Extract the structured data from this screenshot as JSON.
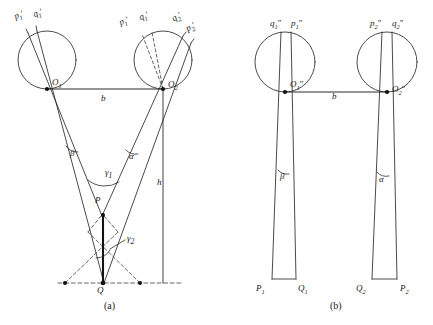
{
  "figure": {
    "captions": [
      {
        "id": "caption-a",
        "text": "(a)",
        "x": 104,
        "y": 302
      },
      {
        "id": "caption-b",
        "text": "(b)",
        "x": 330,
        "y": 302
      }
    ],
    "colors": {
      "stroke": "#2b2b2b",
      "background": "#ffffff",
      "dashed": "#4a4a4a",
      "heavy": "#111111"
    }
  },
  "panel_a": {
    "name": "(a)",
    "circles": [
      {
        "id": "circle-left-a",
        "cx": 47,
        "cy": 60,
        "r": 29,
        "center_label": "O",
        "center_sub": "1"
      },
      {
        "id": "circle-right-a",
        "cx": 163,
        "cy": 60,
        "r": 29,
        "center_label": "O",
        "center_sub": "2"
      }
    ],
    "ray_labels": [
      {
        "id": "label-p1-prime-left",
        "base": "p",
        "sub": "1",
        "prime": "′",
        "x": 17,
        "y": 12,
        "rot": -22
      },
      {
        "id": "label-q1-prime-left",
        "base": "q",
        "sub": "1",
        "prime": "′",
        "x": 36,
        "y": 10,
        "rot": -22
      },
      {
        "id": "label-p1-prime-right",
        "base": "p",
        "sub": "1",
        "prime": "′",
        "x": 122,
        "y": 18,
        "rot": -22
      },
      {
        "id": "label-q1-prime-right",
        "base": "q",
        "sub": "1",
        "prime": "′",
        "x": 142,
        "y": 13,
        "rot": -22
      },
      {
        "id": "label-q2-prime-right",
        "base": "q",
        "sub": "2",
        "prime": "′",
        "x": 176,
        "y": 14,
        "rot": -30
      },
      {
        "id": "label-p2-prime-right",
        "base": "p",
        "sub": "2",
        "prime": "′",
        "x": 190,
        "y": 24,
        "rot": -30
      }
    ],
    "point_labels": [
      {
        "id": "label-O1",
        "base": "O",
        "sub": "1",
        "prime": "",
        "x": 52,
        "y": 80
      },
      {
        "id": "label-O2",
        "base": "O",
        "sub": "2",
        "prime": "",
        "x": 168,
        "y": 82
      },
      {
        "id": "label-P",
        "base": "P",
        "sub": "",
        "prime": "",
        "x": 96,
        "y": 198
      },
      {
        "id": "label-Q",
        "base": "Q",
        "sub": "",
        "prime": "",
        "x": 97,
        "y": 288
      }
    ],
    "measure_labels": [
      {
        "id": "label-b-a",
        "text": "b",
        "x": 101,
        "y": 97
      },
      {
        "id": "label-h-a",
        "text": "h",
        "x": 158,
        "y": 180
      }
    ],
    "angle_labels": [
      {
        "id": "angle-beta-a",
        "text": "β",
        "x": 71,
        "y": 152
      },
      {
        "id": "angle-alpha-a",
        "text": "α",
        "x": 130,
        "y": 155
      },
      {
        "id": "angle-gamma1-a",
        "text": "γ",
        "sub": "1",
        "x": 106,
        "y": 171
      },
      {
        "id": "angle-gamma2-a",
        "text": "γ",
        "sub": "2",
        "x": 128,
        "y": 237
      }
    ]
  },
  "panel_b": {
    "name": "(b)",
    "circles": [
      {
        "id": "circle-left-b",
        "cx": 285,
        "cy": 62,
        "r": 30,
        "center_label": "O",
        "center_sub": "1",
        "center_prime": "″"
      },
      {
        "id": "circle-right-b",
        "cx": 387,
        "cy": 62,
        "r": 30,
        "center_label": "O",
        "center_sub": "2",
        "center_prime": "″"
      }
    ],
    "ray_labels": [
      {
        "id": "label-q1-dprime-left",
        "base": "q",
        "sub": "1",
        "prime": "″",
        "x": 272,
        "y": 20
      },
      {
        "id": "label-p1-dprime-left",
        "base": "p",
        "sub": "1",
        "prime": "″",
        "x": 292,
        "y": 20
      },
      {
        "id": "label-p2-dprime-right",
        "base": "p",
        "sub": "2",
        "prime": "″",
        "x": 371,
        "y": 20
      },
      {
        "id": "label-q2-dprime-right",
        "base": "q",
        "sub": "2",
        "prime": "″",
        "x": 392,
        "y": 20
      }
    ],
    "point_labels": [
      {
        "id": "label-O1-dprime",
        "base": "O",
        "sub": "1",
        "prime": "″",
        "x": 291,
        "y": 82
      },
      {
        "id": "label-O2-dprime",
        "base": "O",
        "sub": "2",
        "prime": "″",
        "x": 393,
        "y": 87
      },
      {
        "id": "label-P1-b",
        "base": "P",
        "sub": "1",
        "prime": "",
        "x": 257,
        "y": 286
      },
      {
        "id": "label-Q1-b",
        "base": "Q",
        "sub": "1",
        "prime": "",
        "x": 295,
        "y": 288
      },
      {
        "id": "label-Q2-b",
        "base": "Q",
        "sub": "2",
        "prime": "",
        "x": 355,
        "y": 288
      },
      {
        "id": "label-P2-b",
        "base": "P",
        "sub": "2",
        "prime": "",
        "x": 399,
        "y": 288
      }
    ],
    "measure_labels": [
      {
        "id": "label-b-b",
        "text": "b",
        "x": 333,
        "y": 95
      }
    ],
    "angle_labels": [
      {
        "id": "angle-beta-b",
        "text": "β",
        "x": 281,
        "y": 175
      },
      {
        "id": "angle-alpha-b",
        "text": "α",
        "x": 380,
        "y": 178
      }
    ]
  }
}
